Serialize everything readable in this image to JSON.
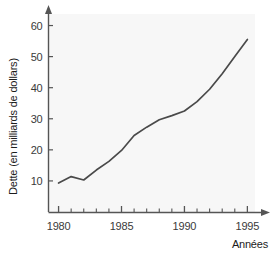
{
  "chart_data": {
    "type": "line",
    "title": "",
    "subtitle": "",
    "xlabel": "Années",
    "ylabel": "Dette (en milliards de dollars)",
    "xlim": [
      1979.2,
      1996.4
    ],
    "ylim": [
      0,
      65
    ],
    "xticks": [
      1980,
      1985,
      1990,
      1995
    ],
    "xtick_labels": [
      "1980",
      "1985",
      "1990",
      "1995"
    ],
    "yticks": [
      10,
      20,
      30,
      40,
      50,
      60
    ],
    "ytick_labels": [
      "10",
      "20",
      "30",
      "40",
      "50",
      "60"
    ],
    "minor_xticks": [
      1981,
      1982,
      1983,
      1984,
      1986,
      1987,
      1988,
      1989,
      1991,
      1992,
      1993,
      1994
    ],
    "grid": false,
    "legend": null,
    "x": [
      1980,
      1981,
      1982,
      1983,
      1984,
      1985,
      1986,
      1987,
      1988,
      1989,
      1990,
      1991,
      1992,
      1993,
      1994,
      1995
    ],
    "values": [
      9.3,
      11.4,
      10.3,
      13.5,
      16.3,
      19.8,
      24.6,
      27.3,
      29.7,
      31.0,
      32.5,
      35.5,
      39.5,
      44.5,
      50.0,
      55.5
    ],
    "series": [
      {
        "name": "Dette",
        "color": "#4a4a4a",
        "values": [
          9.3,
          11.4,
          10.3,
          13.5,
          16.3,
          19.8,
          24.6,
          27.3,
          29.7,
          31.0,
          32.5,
          35.5,
          39.5,
          44.5,
          50.0,
          55.5
        ]
      }
    ],
    "plot_background": "#f7f7f7",
    "axis_color": "#555555",
    "line_color": "#4a4a4a"
  }
}
